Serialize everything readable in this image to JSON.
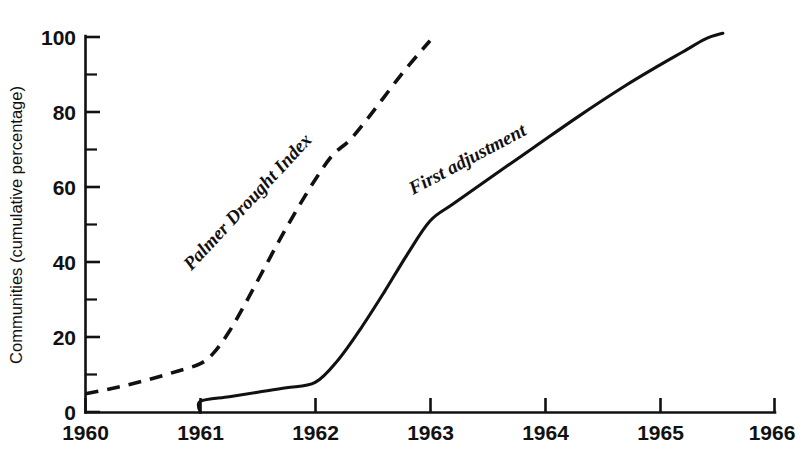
{
  "chart_data": {
    "type": "line",
    "title": "",
    "subtitle": "",
    "xlabel": "",
    "ylabel": "Communities (cumulative percentage)",
    "xlim": [
      1960,
      1966
    ],
    "ylim": [
      0,
      100
    ],
    "grid": false,
    "legend_position": "inline-annotations",
    "x_ticks": [
      "1960",
      "1961",
      "1962",
      "1963",
      "1964",
      "1965",
      "1966"
    ],
    "x_tick_values": [
      1960,
      1961,
      1962,
      1963,
      1964,
      1965,
      1966
    ],
    "x_minor_ticks": false,
    "y_ticks": [
      "0",
      "20",
      "40",
      "60",
      "80",
      "100"
    ],
    "y_tick_values": [
      0,
      20,
      40,
      60,
      80,
      100
    ],
    "y_minor_tick_values": [
      10,
      30,
      50,
      70,
      90
    ],
    "series": [
      {
        "name": "Palmer Drought Index",
        "style": "dashed",
        "color": "#111111",
        "label_angle_deg": -47,
        "label_x": 1961.45,
        "label_y": 55,
        "x": [
          1960.0,
          1960.2,
          1960.4,
          1960.6,
          1960.8,
          1961.0,
          1961.12,
          1961.25,
          1961.4,
          1961.55,
          1961.7,
          1961.85,
          1962.0,
          1962.15,
          1962.3,
          1962.45,
          1962.6,
          1962.75,
          1962.9,
          1963.0
        ],
        "y": [
          5.0,
          6.2,
          7.6,
          9.2,
          11.0,
          13.0,
          16.0,
          21.5,
          29.5,
          38.0,
          46.5,
          54.5,
          62.0,
          68.5,
          72.5,
          78.0,
          84.0,
          90.0,
          95.5,
          99.0
        ]
      },
      {
        "name": "First adjustment",
        "style": "solid",
        "color": "#111111",
        "label_angle_deg": -28,
        "label_x": 1963.35,
        "label_y": 66,
        "x": [
          1961.0,
          1961.0,
          1961.25,
          1961.5,
          1961.75,
          1962.0,
          1962.2,
          1962.4,
          1962.6,
          1962.8,
          1963.0,
          1963.2,
          1963.5,
          1963.9,
          1964.3,
          1964.7,
          1965.0,
          1965.2,
          1965.4,
          1965.55
        ],
        "y": [
          0.0,
          3.0,
          4.2,
          5.4,
          6.6,
          8.0,
          14.0,
          22.5,
          32.0,
          42.0,
          51.0,
          55.5,
          62.0,
          70.5,
          79.0,
          87.0,
          92.5,
          96.0,
          99.5,
          101.0
        ]
      }
    ]
  },
  "axis": {
    "y_title": "Communities (cumulative percentage)"
  },
  "annotations": {
    "palmer_label": "Palmer Drought Index",
    "first_adjustment_label": "First adjustment"
  }
}
